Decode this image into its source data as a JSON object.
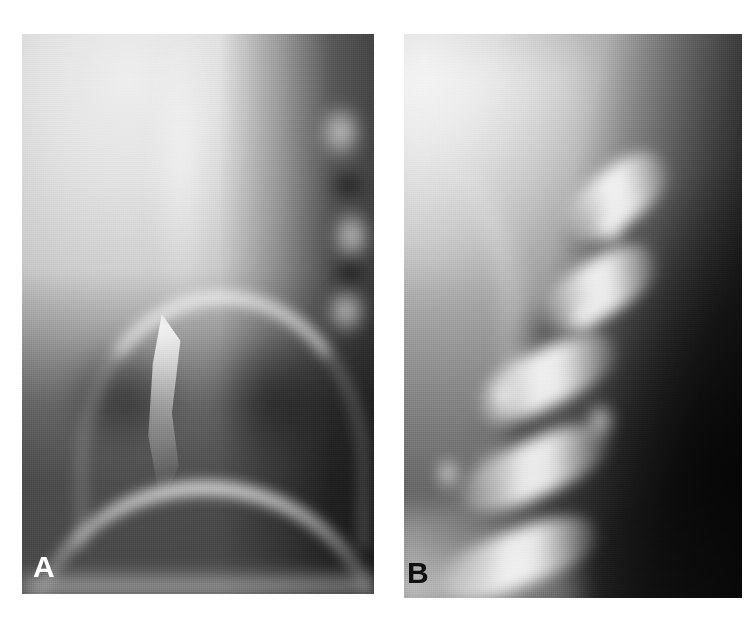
{
  "figure": {
    "type": "radiograph",
    "modality": "plain film radiograph (spine, magnified views)",
    "background_color": "#ffffff",
    "width": 753,
    "height": 636,
    "panel_count": 2
  },
  "panels": [
    {
      "id": "A",
      "label": "A",
      "label_color": "#ffffff",
      "label_position": "bottom-left",
      "x": 22,
      "y": 34,
      "width": 352,
      "height": 560,
      "description": "Magnified radiograph; bright over-exposed upper-left soft tissue, dark paravertebral column on the right with rounded bone densities, large dark vertebral body mass inferiorly bounded by bright curvilinear endplate arcs.",
      "tone": {
        "upper_left": "#ebebeb",
        "mid": "#b4b4b4",
        "lower": "#6e6e6e",
        "right_column": "#3c3c3c",
        "bright_arc": "#f2f2f2"
      }
    },
    {
      "id": "B",
      "label": "B",
      "label_color": "#111111",
      "label_position": "bottom-left",
      "x": 404,
      "y": 34,
      "width": 338,
      "height": 564,
      "description": "Magnified oblique radiograph; bright upper-left field grading to a very dark right and lower-right field, with a series of bright diagonal chevron-shaped endplate/cortical lines descending from upper right to lower left separated by darker interbody spaces.",
      "tone": {
        "upper_left": "#e9e9e9",
        "mid": "#949494",
        "right": "#2a2a2a",
        "lower_right": "#141414",
        "bright_lines": "#f4f4f4"
      }
    }
  ],
  "gap": {
    "between_panels_px": 30,
    "color": "#ffffff"
  }
}
